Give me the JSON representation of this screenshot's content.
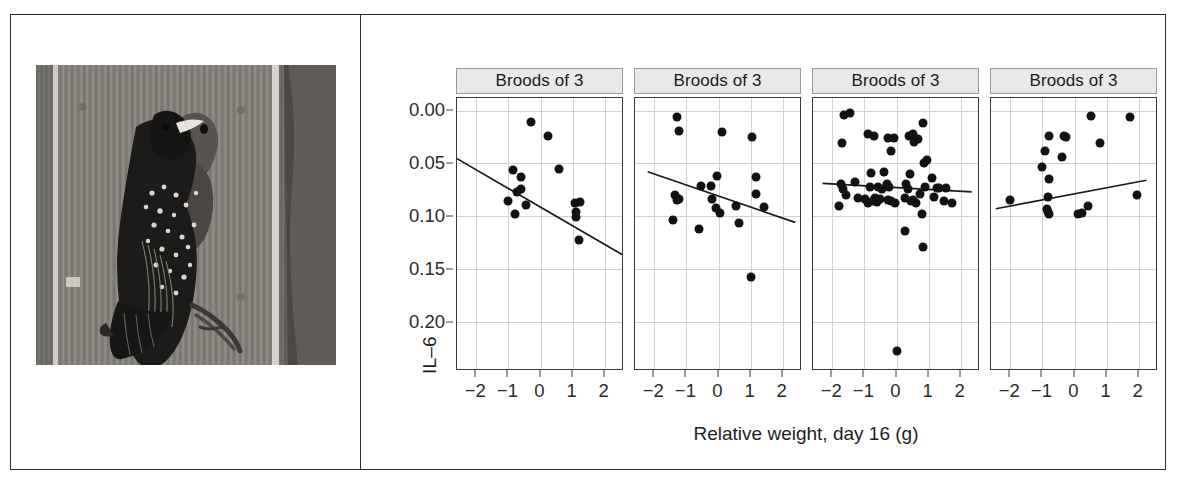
{
  "figure": {
    "photo": {
      "alt_description": "European starling perched on wooden nest box feeding a chick",
      "caption": ""
    }
  },
  "chart_data": {
    "type": "scatter",
    "title": "",
    "xlabel": "Relative weight, day 16 (g)",
    "ylabel": "IL–6",
    "xlim": [
      -2.6,
      2.6
    ],
    "ylim": [
      0.245,
      -0.012
    ],
    "y_axis_reversed": true,
    "grid": true,
    "legend": "none",
    "xticks": [
      -2,
      -1,
      0,
      1,
      2
    ],
    "xticklabels": [
      "−2",
      "−1",
      "0",
      "1",
      "2"
    ],
    "yticks": [
      0.0,
      0.05,
      0.1,
      0.15,
      0.2
    ],
    "yticklabels": [
      "0.00",
      "0.05",
      "0.10",
      "0.15",
      "0.20"
    ],
    "panels": [
      {
        "strip_label": "Broods of 3",
        "fit_line": {
          "x0": -2.6,
          "y0": 0.0455,
          "x1": 2.6,
          "y1": 0.1365
        },
        "points": [
          {
            "x": -0.3,
            "y": 0.011
          },
          {
            "x": 0.22,
            "y": 0.024
          },
          {
            "x": -0.85,
            "y": 0.056
          },
          {
            "x": 0.58,
            "y": 0.055
          },
          {
            "x": -0.6,
            "y": 0.063
          },
          {
            "x": -0.72,
            "y": 0.077
          },
          {
            "x": -0.62,
            "y": 0.074
          },
          {
            "x": -1.0,
            "y": 0.086
          },
          {
            "x": -0.45,
            "y": 0.089
          },
          {
            "x": -0.78,
            "y": 0.098
          },
          {
            "x": 1.08,
            "y": 0.088
          },
          {
            "x": 1.22,
            "y": 0.087
          },
          {
            "x": 1.1,
            "y": 0.096
          },
          {
            "x": 1.12,
            "y": 0.101
          },
          {
            "x": 1.2,
            "y": 0.123
          }
        ]
      },
      {
        "strip_label": "Broods of 3",
        "fit_line": {
          "x0": -2.2,
          "y0": 0.058,
          "x1": 2.45,
          "y1": 0.106
        },
        "points": [
          {
            "x": -1.3,
            "y": 0.006
          },
          {
            "x": 0.1,
            "y": 0.02
          },
          {
            "x": -1.22,
            "y": 0.019
          },
          {
            "x": 1.05,
            "y": 0.025
          },
          {
            "x": -0.05,
            "y": 0.062
          },
          {
            "x": 1.18,
            "y": 0.063
          },
          {
            "x": -0.55,
            "y": 0.071
          },
          {
            "x": -0.22,
            "y": 0.071
          },
          {
            "x": 1.18,
            "y": 0.079
          },
          {
            "x": -1.35,
            "y": 0.08
          },
          {
            "x": -1.28,
            "y": 0.085
          },
          {
            "x": -1.22,
            "y": 0.084
          },
          {
            "x": -0.2,
            "y": 0.084
          },
          {
            "x": -0.08,
            "y": 0.092
          },
          {
            "x": 0.55,
            "y": 0.09
          },
          {
            "x": 1.42,
            "y": 0.091
          },
          {
            "x": 0.05,
            "y": 0.097
          },
          {
            "x": -1.42,
            "y": 0.104
          },
          {
            "x": -0.62,
            "y": 0.112
          },
          {
            "x": 0.65,
            "y": 0.107
          },
          {
            "x": 1.0,
            "y": 0.158
          }
        ]
      },
      {
        "strip_label": "Broods of 3",
        "fit_line": {
          "x0": -2.3,
          "y0": 0.069,
          "x1": 2.4,
          "y1": 0.077
        },
        "points": [
          {
            "x": -1.62,
            "y": 0.004
          },
          {
            "x": -1.45,
            "y": 0.002
          },
          {
            "x": 0.82,
            "y": 0.012
          },
          {
            "x": -0.9,
            "y": 0.022
          },
          {
            "x": -0.7,
            "y": 0.024
          },
          {
            "x": -0.25,
            "y": 0.026
          },
          {
            "x": -0.08,
            "y": 0.026
          },
          {
            "x": 0.38,
            "y": 0.024
          },
          {
            "x": 0.5,
            "y": 0.022
          },
          {
            "x": 0.55,
            "y": 0.03
          },
          {
            "x": 0.68,
            "y": 0.027
          },
          {
            "x": -1.7,
            "y": 0.031
          },
          {
            "x": -0.16,
            "y": 0.038
          },
          {
            "x": 0.85,
            "y": 0.05
          },
          {
            "x": 0.95,
            "y": 0.047
          },
          {
            "x": -0.78,
            "y": 0.059
          },
          {
            "x": -0.38,
            "y": 0.058
          },
          {
            "x": 0.42,
            "y": 0.06
          },
          {
            "x": 1.1,
            "y": 0.064
          },
          {
            "x": -1.72,
            "y": 0.07
          },
          {
            "x": -1.66,
            "y": 0.074
          },
          {
            "x": -1.3,
            "y": 0.068
          },
          {
            "x": -0.82,
            "y": 0.072
          },
          {
            "x": -0.58,
            "y": 0.072
          },
          {
            "x": -0.45,
            "y": 0.074
          },
          {
            "x": -0.3,
            "y": 0.07
          },
          {
            "x": -0.22,
            "y": 0.072
          },
          {
            "x": 0.3,
            "y": 0.07
          },
          {
            "x": 0.35,
            "y": 0.074
          },
          {
            "x": 0.88,
            "y": 0.072
          },
          {
            "x": 1.25,
            "y": 0.073
          },
          {
            "x": 1.32,
            "y": 0.073
          },
          {
            "x": 1.55,
            "y": 0.073
          },
          {
            "x": -1.58,
            "y": 0.08
          },
          {
            "x": -1.2,
            "y": 0.083
          },
          {
            "x": -0.98,
            "y": 0.084
          },
          {
            "x": -0.88,
            "y": 0.088
          },
          {
            "x": -0.74,
            "y": 0.086
          },
          {
            "x": -0.68,
            "y": 0.083
          },
          {
            "x": -0.62,
            "y": 0.087
          },
          {
            "x": -0.5,
            "y": 0.084
          },
          {
            "x": -0.28,
            "y": 0.085
          },
          {
            "x": -0.18,
            "y": 0.086
          },
          {
            "x": -0.05,
            "y": 0.088
          },
          {
            "x": 0.28,
            "y": 0.083
          },
          {
            "x": 0.44,
            "y": 0.086
          },
          {
            "x": 0.52,
            "y": 0.085
          },
          {
            "x": 0.6,
            "y": 0.088
          },
          {
            "x": 0.72,
            "y": 0.079
          },
          {
            "x": 1.18,
            "y": 0.082
          },
          {
            "x": 1.48,
            "y": 0.086
          },
          {
            "x": 1.72,
            "y": 0.088
          },
          {
            "x": -1.78,
            "y": 0.09
          },
          {
            "x": 0.8,
            "y": 0.098
          },
          {
            "x": 0.25,
            "y": 0.114
          },
          {
            "x": 0.82,
            "y": 0.129
          },
          {
            "x": 0.02,
            "y": 0.228
          }
        ]
      },
      {
        "strip_label": "Broods of 3",
        "fit_line": {
          "x0": -2.45,
          "y0": 0.093,
          "x1": 2.3,
          "y1": 0.066
        },
        "points": [
          {
            "x": 0.52,
            "y": 0.005
          },
          {
            "x": 1.72,
            "y": 0.006
          },
          {
            "x": -0.8,
            "y": 0.024
          },
          {
            "x": -0.32,
            "y": 0.024
          },
          {
            "x": -0.28,
            "y": 0.025
          },
          {
            "x": 0.78,
            "y": 0.031
          },
          {
            "x": -0.92,
            "y": 0.038
          },
          {
            "x": -0.4,
            "y": 0.044
          },
          {
            "x": -1.0,
            "y": 0.053
          },
          {
            "x": -0.8,
            "y": 0.065
          },
          {
            "x": -2.0,
            "y": 0.085
          },
          {
            "x": -0.82,
            "y": 0.082
          },
          {
            "x": 1.95,
            "y": 0.08
          },
          {
            "x": -0.85,
            "y": 0.093
          },
          {
            "x": -0.82,
            "y": 0.096
          },
          {
            "x": -0.78,
            "y": 0.098
          },
          {
            "x": 0.42,
            "y": 0.09
          },
          {
            "x": 0.12,
            "y": 0.098
          },
          {
            "x": 0.22,
            "y": 0.097
          }
        ]
      }
    ]
  }
}
